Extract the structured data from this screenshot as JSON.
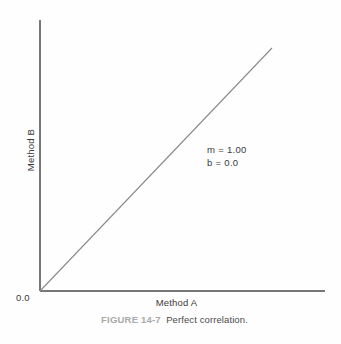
{
  "chart_data": {
    "type": "line",
    "title": "",
    "subtitle": "",
    "xlabel": "Method A",
    "ylabel": "Method B",
    "xlim": [
      0,
      1
    ],
    "ylim": [
      0,
      1
    ],
    "grid": false,
    "legend": null,
    "tick_labels": {
      "origin": "0.0",
      "x": [],
      "y": []
    },
    "series": [
      {
        "name": "Perfect correlation line",
        "x": [
          0,
          1
        ],
        "y": [
          0,
          1
        ],
        "color": "#8a8a8a",
        "slope": 1.0,
        "intercept": 0.0
      }
    ],
    "annotations": [
      {
        "text": "m = 1.00"
      },
      {
        "text": "b = 0.0"
      }
    ]
  },
  "figure": {
    "caption_number": "FIGURE 14-7",
    "caption_text": "Perfect correlation."
  },
  "colors": {
    "axis": "#4a4a4a",
    "line": "#8a8a8a",
    "text": "#3a3a3a",
    "caption_number": "#a8a8a8",
    "caption_text": "#4a4a4a",
    "background": "#fefefe"
  }
}
